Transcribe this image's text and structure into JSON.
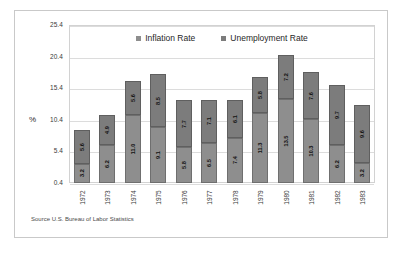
{
  "chart_data": {
    "type": "bar",
    "subtype": "stacked",
    "title": "",
    "xlabel": "",
    "ylabel": "%",
    "ylim": [
      0.4,
      25.4
    ],
    "yticks": [
      "0.4",
      "5.4",
      "10.4",
      "15.4",
      "20.4",
      "25.4"
    ],
    "grid": true,
    "legend_position": "top-center",
    "categories": [
      "1972",
      "1973",
      "1974",
      "1975",
      "1976",
      "1977",
      "1978",
      "1979",
      "1980",
      "1981",
      "1982",
      "1983"
    ],
    "series": [
      {
        "name": "Inflation Rate",
        "color": "#8e8e8e",
        "values": [
          3.2,
          6.2,
          11.0,
          9.1,
          5.8,
          6.5,
          7.4,
          11.3,
          13.5,
          10.3,
          6.2,
          3.2
        ]
      },
      {
        "name": "Unemployment Rate",
        "color": "#7c7c7c",
        "values": [
          5.6,
          4.9,
          5.6,
          8.5,
          7.7,
          7.1,
          6.1,
          5.8,
          7.2,
          7.6,
          9.7,
          9.6
        ]
      }
    ],
    "annotations": {
      "source": "Source U.S. Bureau of Labor Statistics"
    }
  }
}
